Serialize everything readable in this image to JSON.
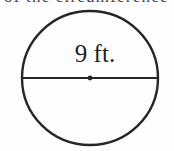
{
  "figure": {
    "kind": "geometry-diagram",
    "shape_name": "circle",
    "background_color": "#fefefe",
    "stroke_color": "#262626",
    "text_color": "#1d1d1d",
    "clipped_header_text": "of the circumference",
    "circle": {
      "center_x": 90,
      "center_y": 78,
      "radius_x": 68,
      "radius_y": 67,
      "stroke_width": 2.4
    },
    "diameter_segment": {
      "label": "9 ft.",
      "value": 9,
      "unit": "ft.",
      "x1": 22,
      "x2": 158,
      "y": 78,
      "stroke_width": 2.2
    },
    "center_point": {
      "x": 90,
      "y": 78,
      "radius": 2.4
    },
    "label_position": {
      "x": 95,
      "y": 62,
      "anchor": "middle"
    }
  }
}
